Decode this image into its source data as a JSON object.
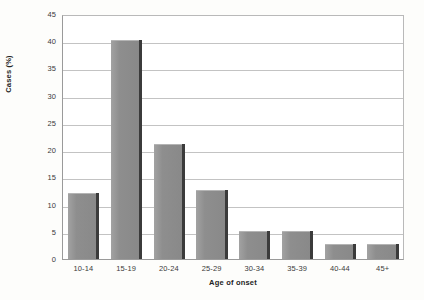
{
  "chart_data": {
    "type": "bar",
    "title": "",
    "subtitle": "",
    "xlabel": "Age of onset",
    "ylabel": "Cases (%)",
    "categories": [
      "10-14",
      "15-19",
      "20-24",
      "25-29",
      "30-34",
      "35-39",
      "40-44",
      "45+"
    ],
    "values": [
      12,
      40,
      21,
      12.5,
      5,
      5,
      2.5,
      2.5
    ],
    "ylim": [
      0,
      45
    ],
    "yticks": [
      0,
      5,
      10,
      15,
      20,
      25,
      30,
      35,
      40,
      45
    ],
    "ytick_labels": [
      "0",
      "5",
      "10",
      "15",
      "20",
      "25",
      "30",
      "35",
      "40",
      "45"
    ],
    "grid": "horizontal",
    "legend": "none",
    "bar_color": "#8e8e8e",
    "bar_shadow_color": "#3b3b3b",
    "gridline_color": "#c3c3c3",
    "axis_color": "#9a9a9a",
    "background_color": "#fdfdfb",
    "plot_background_color": "#ffffff"
  }
}
